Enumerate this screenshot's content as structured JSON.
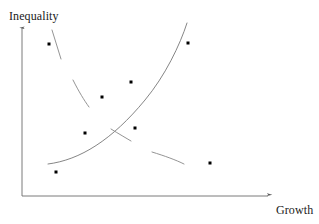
{
  "chart_data": {
    "type": "scatter",
    "title": "",
    "subtitle": "",
    "xlabel": "Growth",
    "ylabel": "Inequality",
    "grid": false,
    "legend": null,
    "axes": {
      "style": "arrow",
      "origin_px": [
        22,
        196
      ],
      "x_axis_end_px": [
        272,
        196
      ],
      "y_axis_end_px": [
        22,
        25
      ],
      "ticks": [],
      "tick_labels": [],
      "xlim": [
        0,
        1
      ],
      "ylim": [
        0,
        1
      ]
    },
    "points": [
      {
        "id": "p1",
        "x": 0.11,
        "y": 0.89,
        "px": [
          49,
          44
        ]
      },
      {
        "id": "p2",
        "x": 0.44,
        "y": 0.67,
        "px": [
          131,
          82
        ]
      },
      {
        "id": "p3",
        "x": 0.32,
        "y": 0.58,
        "px": [
          102,
          97
        ]
      },
      {
        "id": "p4",
        "x": 0.66,
        "y": 0.89,
        "px": [
          188,
          43
        ]
      },
      {
        "id": "p5",
        "x": 0.25,
        "y": 0.37,
        "px": [
          85,
          133
        ]
      },
      {
        "id": "p6",
        "x": 0.45,
        "y": 0.4,
        "px": [
          135,
          128
        ]
      },
      {
        "id": "p7",
        "x": 0.14,
        "y": 0.14,
        "px": [
          56,
          172
        ]
      },
      {
        "id": "p8",
        "x": 0.75,
        "y": 0.19,
        "px": [
          210,
          163
        ]
      }
    ],
    "marker": {
      "shape": "square",
      "size_px": 3,
      "color": "#000000"
    },
    "curves": [
      {
        "name": "rising-trend",
        "label": "increasing relationship",
        "style": "solid",
        "color": "#777777",
        "width_px": 0.9,
        "path": "M 48 164 C 80 160, 112 140, 145 100 C 165 76, 180 45, 187 23"
      },
      {
        "name": "declining-trend-seg-1",
        "label": "decreasing relationship",
        "style": "solid",
        "color": "#888888",
        "width_px": 0.9,
        "path": "M 52 30 L 61 59"
      },
      {
        "name": "declining-trend-seg-2",
        "label": "decreasing relationship",
        "style": "solid",
        "color": "#888888",
        "width_px": 0.9,
        "path": "M 73 80 C 79 92, 84 100, 89 107"
      },
      {
        "name": "declining-trend-seg-3",
        "label": "decreasing relationship",
        "style": "solid",
        "color": "#888888",
        "width_px": 0.9,
        "path": "M 111 129 C 119 134, 126 138, 131 141"
      },
      {
        "name": "declining-trend-seg-4",
        "label": "decreasing relationship",
        "style": "solid",
        "color": "#888888",
        "width_px": 0.9,
        "path": "M 152 152 C 165 156, 176 160, 184 164"
      }
    ],
    "colors": {
      "axis": "#6b6b6b",
      "marker": "#000000",
      "curve_rising": "#777777",
      "curve_declining": "#888888",
      "text": "#1a1a1a",
      "background": "#ffffff"
    }
  }
}
